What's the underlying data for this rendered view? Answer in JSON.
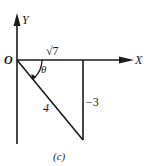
{
  "figure": {
    "caption": "(c)",
    "axes": {
      "x_label": "X",
      "y_label": "Y",
      "origin_label": "O"
    },
    "angle_label": "θ",
    "sides": {
      "adjacent": "√7",
      "hypotenuse": "4",
      "opposite": "−3"
    },
    "colors": {
      "stroke": "#1a1a1a",
      "background": "#ffffff"
    }
  }
}
